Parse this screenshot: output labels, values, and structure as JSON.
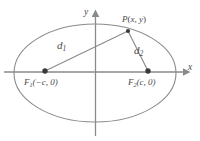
{
  "figure": {
    "kind": "ellipse-foci-diagram",
    "colors": {
      "curve": "#8a8a8a",
      "axis": "#8a8a8a",
      "segment": "#8a8a8a",
      "marker": "#3a3a3a",
      "text": "#4a4a4a",
      "background": "#ffffff"
    },
    "axes": {
      "x_label": "x",
      "y_label": "y",
      "origin": {
        "x": 95,
        "y": 72
      }
    },
    "ellipse": {
      "center": {
        "x": 95,
        "y": 73
      },
      "semi_major": 81,
      "semi_minor": 49
    },
    "points": {
      "P": {
        "label_main": "P",
        "label_paren_open": "(",
        "label_x": "x",
        "label_comma": ", ",
        "label_y": "y",
        "label_paren_close": ")",
        "x": 128,
        "y": 31
      },
      "F1": {
        "label_main": "F",
        "label_sub": "1",
        "label_coords": "(−c, 0)",
        "x": 45,
        "y": 71
      },
      "F2": {
        "label_main": "F",
        "label_sub": "2",
        "label_coords": "(c, 0)",
        "x": 148,
        "y": 71
      }
    },
    "segments": {
      "d1": {
        "label_main": "d",
        "label_sub": "1",
        "from": "F1",
        "to": "P"
      },
      "d2": {
        "label_main": "d",
        "label_sub": "2",
        "from": "F2",
        "to": "P"
      }
    }
  }
}
